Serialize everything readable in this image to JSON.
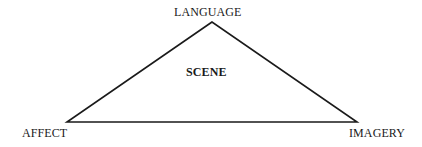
{
  "diagram": {
    "type": "triangle",
    "center_label": "SCENE",
    "vertices": [
      {
        "id": "top",
        "label": "LANGUAGE"
      },
      {
        "id": "bottom-left",
        "label": "AFFECT"
      },
      {
        "id": "bottom-right",
        "label": "IMAGERY"
      }
    ],
    "colors": {
      "line": "#1a1a1a",
      "text": "#1a1a1a",
      "background": "#ffffff"
    }
  }
}
